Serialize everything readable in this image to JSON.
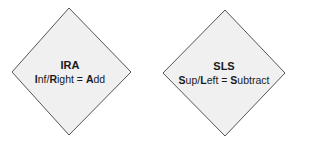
{
  "diagram": {
    "fill_color": "#f0f0f0",
    "stroke_color": "#555555",
    "nodes": [
      {
        "shape": "diamond",
        "title": "IRA",
        "rule_parts": [
          {
            "text": "I",
            "bold": true
          },
          {
            "text": "nf/",
            "bold": false
          },
          {
            "text": "R",
            "bold": true
          },
          {
            "text": "ight = ",
            "bold": false
          },
          {
            "text": "A",
            "bold": true
          },
          {
            "text": "dd",
            "bold": false
          }
        ],
        "rule": "Inf/Right = Add"
      },
      {
        "shape": "diamond",
        "title": "SLS",
        "rule_parts": [
          {
            "text": "S",
            "bold": true
          },
          {
            "text": "up/",
            "bold": false
          },
          {
            "text": "L",
            "bold": true
          },
          {
            "text": "eft = ",
            "bold": false
          },
          {
            "text": "S",
            "bold": true
          },
          {
            "text": "ubtract",
            "bold": false
          }
        ],
        "rule": "Sup/Left = Subtract"
      }
    ]
  }
}
